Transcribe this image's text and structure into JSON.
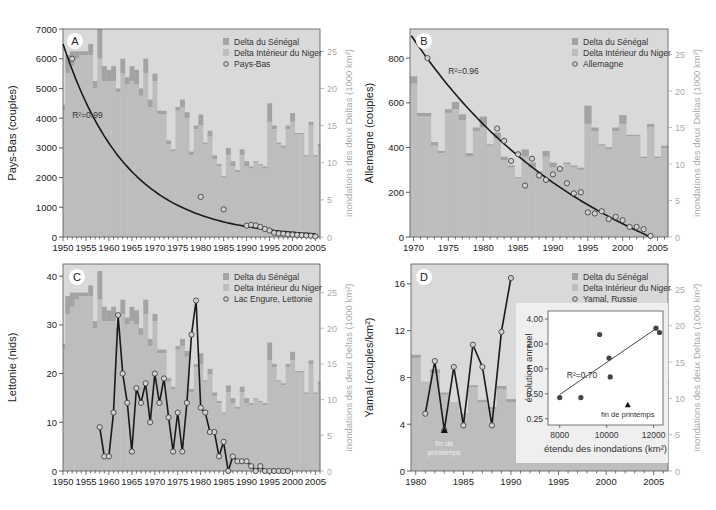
{
  "colors": {
    "background": "#d9d9d9",
    "niger": "#bdbdbd",
    "senegal": "#a3a3a3",
    "line": "#1a1a1a",
    "marker_fill": "#d0d0d0",
    "right_axis": "#aaaaaa"
  },
  "legend": {
    "senegal": "Delta du Sénégal",
    "niger": "Delta Intérieur du Niger"
  },
  "right_axis_label": "inondations des deux Deltas (1000 km²)",
  "chart_data": [
    {
      "id": "A",
      "type": "bar+line",
      "panel_letter": "A",
      "ylabel": "Pays-Bas (couples)",
      "ylabel_right": "inondations des deux Deltas (1000 km²)",
      "xlim": [
        1950,
        2006
      ],
      "ylim": [
        0,
        7000
      ],
      "ylim_right": [
        0,
        28
      ],
      "yticks": [
        0,
        1000,
        2000,
        3000,
        4000,
        5000,
        6000,
        7000
      ],
      "yticks_right": [
        0,
        5,
        10,
        15,
        20,
        25
      ],
      "xticks": [
        1950,
        1955,
        1960,
        1965,
        1970,
        1975,
        1980,
        1985,
        1990,
        1995,
        2000,
        2005
      ],
      "series_name": "Pays-Bas",
      "r2_label": "R²=0.99",
      "r2_pos": [
        1952,
        4000
      ],
      "fit": "exp",
      "fit_range": [
        1950,
        2005
      ],
      "fit_params": {
        "a": 6500,
        "b": -0.072,
        "x0": 1950
      },
      "points": [
        [
          1952,
          6000
        ],
        [
          1980,
          1350
        ],
        [
          1985,
          930
        ],
        [
          1990,
          380
        ],
        [
          1991,
          410
        ],
        [
          1992,
          390
        ],
        [
          1993,
          340
        ],
        [
          1994,
          270
        ],
        [
          1995,
          220
        ],
        [
          1996,
          140
        ],
        [
          1997,
          120
        ],
        [
          1998,
          110
        ],
        [
          1999,
          90
        ],
        [
          2000,
          80
        ],
        [
          2001,
          70
        ],
        [
          2002,
          60
        ],
        [
          2003,
          50
        ],
        [
          2004,
          40
        ],
        [
          2005,
          20
        ]
      ],
      "connect_points": false,
      "bars_years": [
        1950,
        1951,
        1952,
        1953,
        1954,
        1955,
        1956,
        1957,
        1958,
        1959,
        1960,
        1961,
        1962,
        1963,
        1964,
        1965,
        1966,
        1967,
        1968,
        1969,
        1970,
        1971,
        1972,
        1973,
        1974,
        1975,
        1976,
        1977,
        1978,
        1979,
        1980,
        1981,
        1982,
        1983,
        1984,
        1985,
        1986,
        1987,
        1988,
        1989,
        1990,
        1991,
        1992,
        1993,
        1994,
        1995,
        1996,
        1997,
        1998,
        1999,
        2000,
        2001,
        2002,
        2003,
        2004,
        2005,
        2006
      ],
      "bars_niger": [
        17,
        22,
        23,
        24,
        24.5,
        24.5,
        24.5,
        20,
        24,
        21,
        21,
        21,
        19.5,
        22,
        20.5,
        21,
        20.5,
        19,
        22,
        17.5,
        21,
        16.5,
        16.5,
        12.5,
        11.5,
        17,
        17.5,
        16,
        11,
        14.5,
        15,
        12.5,
        13.5,
        10.5,
        9.5,
        8,
        11,
        9.5,
        8.7,
        11,
        9.5,
        9.2,
        10,
        9.6,
        9.2,
        15.5,
        14.5,
        12.5,
        12,
        14.5,
        15.5,
        13.8,
        13.8,
        10.8,
        15,
        10.8,
        12.2
      ],
      "bars_total": [
        17.8,
        24.5,
        25,
        25,
        25,
        25,
        26,
        21,
        28,
        23,
        22.5,
        23,
        20,
        24,
        21.5,
        23,
        22.5,
        20,
        24,
        18.5,
        22,
        17,
        17,
        13,
        11.8,
        17.5,
        18.5,
        16.8,
        11.5,
        15,
        16.5,
        12.7,
        14.3,
        11,
        9.8,
        8.2,
        12,
        10.2,
        9,
        11.8,
        10.2,
        9.5,
        10.2,
        9.8,
        9.5,
        18,
        15,
        12.7,
        12.3,
        15,
        16.7,
        14,
        14,
        11,
        15.5,
        11,
        12.5
      ]
    },
    {
      "id": "B",
      "type": "bar+line",
      "panel_letter": "B",
      "ylabel": "Allemagne (couples)",
      "ylabel_right": "inondations des deux Deltas (1000 km²)",
      "xlim": [
        1969.5,
        2006.5
      ],
      "ylim": [
        0,
        930
      ],
      "ylim_right": [
        0,
        28.5
      ],
      "yticks": [
        0,
        200,
        400,
        600,
        800
      ],
      "yticks_right": [
        0,
        5,
        10,
        15,
        20,
        25
      ],
      "xticks": [
        1970,
        1975,
        1980,
        1985,
        1990,
        1995,
        2000,
        2005
      ],
      "series_name": "Allemagne",
      "r2_label": "R²=0.96",
      "r2_pos": [
        1975,
        730
      ],
      "fit": "exp2",
      "fit_range": [
        1969.7,
        2004
      ],
      "fit_params": {
        "a": 900,
        "b": -0.046,
        "x0": 1969.7,
        "end": 2004
      },
      "points": [
        [
          1972,
          800
        ],
        [
          1982,
          485
        ],
        [
          1983,
          430
        ],
        [
          1984,
          340
        ],
        [
          1985,
          370
        ],
        [
          1986,
          230
        ],
        [
          1987,
          350
        ],
        [
          1988,
          275
        ],
        [
          1989,
          255
        ],
        [
          1990,
          280
        ],
        [
          1991,
          305
        ],
        [
          1992,
          240
        ],
        [
          1993,
          195
        ],
        [
          1994,
          200
        ],
        [
          1995,
          110
        ],
        [
          1996,
          105
        ],
        [
          1997,
          115
        ],
        [
          1998,
          80
        ],
        [
          1999,
          90
        ],
        [
          2000,
          75
        ],
        [
          2001,
          45
        ],
        [
          2002,
          45
        ],
        [
          2003,
          35
        ],
        [
          2004,
          5
        ]
      ],
      "connect_points": false,
      "bars_years": [
        1970,
        1971,
        1972,
        1973,
        1974,
        1975,
        1976,
        1977,
        1978,
        1979,
        1980,
        1981,
        1982,
        1983,
        1984,
        1985,
        1986,
        1987,
        1988,
        1989,
        1990,
        1991,
        1992,
        1993,
        1994,
        1995,
        1996,
        1997,
        1998,
        1999,
        2000,
        2001,
        2002,
        2003,
        2004,
        2005,
        2006
      ],
      "bars_niger": [
        21,
        16.5,
        16.5,
        12.5,
        11.5,
        17,
        17.5,
        16,
        11,
        14.5,
        15,
        12.5,
        13.5,
        10.5,
        9.5,
        8,
        11,
        9.5,
        8.7,
        11,
        9.5,
        9.2,
        10,
        9.6,
        9.2,
        15.5,
        14.5,
        12.5,
        12,
        14.5,
        15.5,
        13.8,
        13.8,
        10.8,
        15,
        10.8,
        12.2
      ],
      "bars_total": [
        22,
        17,
        17,
        13,
        11.8,
        17.5,
        18.5,
        16.8,
        11.5,
        15,
        16.5,
        12.7,
        14.3,
        11,
        9.8,
        8.2,
        12,
        10.2,
        9,
        11.8,
        10.2,
        9.5,
        10.2,
        9.8,
        9.5,
        18,
        15,
        12.7,
        12.3,
        15,
        16.7,
        14,
        14,
        11,
        15.5,
        11,
        12.5
      ]
    },
    {
      "id": "C",
      "type": "bar+line",
      "panel_letter": "C",
      "ylabel": "Lettonie (nids)",
      "ylabel_right": "inondations des deux Deltas (1000 km²)",
      "xlim": [
        1950,
        2006
      ],
      "ylim": [
        0,
        42.5
      ],
      "ylim_right": [
        0,
        29
      ],
      "yticks": [
        0,
        10,
        20,
        30,
        40
      ],
      "yticks_right": [
        0,
        5,
        10,
        15,
        20,
        25
      ],
      "xticks": [
        1950,
        1955,
        1960,
        1965,
        1970,
        1975,
        1980,
        1985,
        1990,
        1995,
        2000,
        2005
      ],
      "series_name": "Lac Engure, Lettonie",
      "r2_label": "",
      "points": [
        [
          1958,
          9
        ],
        [
          1959,
          3
        ],
        [
          1960,
          3
        ],
        [
          1961,
          12
        ],
        [
          1962,
          32
        ],
        [
          1963,
          20
        ],
        [
          1964,
          14
        ],
        [
          1965,
          4
        ],
        [
          1966,
          17
        ],
        [
          1967,
          14
        ],
        [
          1968,
          18
        ],
        [
          1969,
          10
        ],
        [
          1970,
          20
        ],
        [
          1971,
          14
        ],
        [
          1972,
          19
        ],
        [
          1973,
          11
        ],
        [
          1974,
          4
        ],
        [
          1975,
          12
        ],
        [
          1976,
          4
        ],
        [
          1977,
          14
        ],
        [
          1978,
          28
        ],
        [
          1979,
          35
        ],
        [
          1980,
          13
        ],
        [
          1981,
          12
        ],
        [
          1982,
          8
        ],
        [
          1983,
          8
        ],
        [
          1984,
          3
        ],
        [
          1985,
          6
        ],
        [
          1986,
          0
        ],
        [
          1987,
          3
        ],
        [
          1988,
          2
        ],
        [
          1989,
          2
        ],
        [
          1990,
          2
        ],
        [
          1991,
          1
        ],
        [
          1992,
          0
        ],
        [
          1993,
          1
        ],
        [
          1994,
          0
        ],
        [
          1995,
          0
        ],
        [
          1996,
          0
        ],
        [
          1997,
          0
        ],
        [
          1998,
          0
        ],
        [
          1999,
          0
        ]
      ],
      "connect_points": true,
      "bars_years": [
        1950,
        1951,
        1952,
        1953,
        1954,
        1955,
        1956,
        1957,
        1958,
        1959,
        1960,
        1961,
        1962,
        1963,
        1964,
        1965,
        1966,
        1967,
        1968,
        1969,
        1970,
        1971,
        1972,
        1973,
        1974,
        1975,
        1976,
        1977,
        1978,
        1979,
        1980,
        1981,
        1982,
        1983,
        1984,
        1985,
        1986,
        1987,
        1988,
        1989,
        1990,
        1991,
        1992,
        1993,
        1994,
        1995,
        1996,
        1997,
        1998,
        1999,
        2000,
        2001,
        2002,
        2003,
        2004,
        2005,
        2006
      ],
      "bars_niger": [
        17,
        22,
        23,
        24,
        24.5,
        24.5,
        24.5,
        20,
        24,
        21,
        21,
        21,
        19.5,
        22,
        20.5,
        21,
        20.5,
        19,
        22,
        17.5,
        21,
        16.5,
        16.5,
        12.5,
        11.5,
        17,
        17.5,
        16,
        11,
        14.5,
        15,
        12.5,
        13.5,
        10.5,
        9.5,
        8,
        11,
        9.5,
        8.7,
        11,
        9.5,
        9.2,
        10,
        9.6,
        9.2,
        15.5,
        14.5,
        12.5,
        12,
        14.5,
        15.5,
        13.8,
        13.8,
        10.8,
        15,
        10.8,
        12.2
      ],
      "bars_total": [
        17.8,
        24.5,
        25,
        25,
        25,
        25,
        26,
        21,
        28,
        23,
        22.5,
        23,
        20,
        24,
        21.5,
        23,
        22.5,
        20,
        24,
        18.5,
        22,
        17,
        17,
        13,
        11.8,
        17.5,
        18.5,
        16.8,
        11.5,
        15,
        16.5,
        12.7,
        14.3,
        11,
        9.8,
        8.2,
        12,
        10.2,
        9,
        11.8,
        10.2,
        9.5,
        10.2,
        9.8,
        9.5,
        18,
        15,
        12.7,
        12.3,
        15,
        16.7,
        14,
        14,
        11,
        15.5,
        11,
        12.5
      ]
    },
    {
      "id": "D",
      "type": "bar+line",
      "panel_letter": "D",
      "ylabel": "Yamal (couples/km²)",
      "ylabel_right": "inondations des deux Deltas (1000 km²)",
      "xlim": [
        1979.5,
        2006.5
      ],
      "ylim": [
        0,
        17.7
      ],
      "ylim_right": [
        0,
        28.5
      ],
      "yticks": [
        0,
        4,
        8,
        12,
        16
      ],
      "yticks_right": [
        0,
        5,
        10,
        15,
        20,
        25
      ],
      "xticks": [
        1980,
        1985,
        1990,
        1995,
        2000,
        2005
      ],
      "series_name": "Yamal, Russie",
      "r2_label": "",
      "points": [
        [
          1981,
          4.9
        ],
        [
          1982,
          9.4
        ],
        [
          1983,
          3.5
        ],
        [
          1984,
          8.9
        ],
        [
          1985,
          3.9
        ],
        [
          1986,
          10.8
        ],
        [
          1987,
          8.9
        ],
        [
          1988,
          3.9
        ],
        [
          1989,
          11.9
        ],
        [
          1990,
          16.5
        ]
      ],
      "late_spring_point": [
        1983,
        3.5
      ],
      "late_spring_label": "fin de printemps",
      "connect_points": true,
      "bars_years": [
        1980,
        1981,
        1982,
        1983,
        1984,
        1985,
        1986,
        1987,
        1988,
        1989,
        1990,
        1991,
        1992,
        1993,
        1994,
        1995,
        1996,
        1997,
        1998,
        1999,
        2000,
        2001,
        2002,
        2003,
        2004,
        2005,
        2006
      ],
      "bars_niger": [
        15.5,
        12.3,
        13.5,
        10.5,
        9.5,
        8,
        11.5,
        9.5,
        8.5,
        11.3,
        9.5,
        9.2,
        10,
        9.6,
        9.2,
        15.5,
        14.5,
        12.5,
        12,
        14.5,
        15.5,
        13.8,
        13.8,
        10.8,
        15,
        10.8,
        12.2
      ],
      "bars_total": [
        16,
        12.3,
        14,
        10.8,
        9.5,
        8,
        11.8,
        9.8,
        8.8,
        11.7,
        9.9,
        9.5,
        10.2,
        9.8,
        9.5,
        18,
        15,
        12.7,
        12.3,
        15,
        16.7,
        14,
        14,
        11,
        15.5,
        11,
        12.5
      ],
      "inset": {
        "type": "scatter",
        "xlabel": "étendu des inondations (km²)",
        "ylabel": "évolution annuel",
        "xticks": [
          8000,
          10000,
          12000
        ],
        "yticks": [
          0.25,
          0.5,
          1.0,
          2.0,
          4.0
        ],
        "ytick_labels": [
          "0.25",
          "0.50",
          "1.00",
          "2.00",
          "4.00"
        ],
        "yscale": "log2",
        "xlim": [
          7500,
          12400
        ],
        "ylim": [
          0.21,
          5.0
        ],
        "points": [
          [
            8000,
            0.45
          ],
          [
            8900,
            0.45
          ],
          [
            9700,
            2.6
          ],
          [
            10100,
            1.35
          ],
          [
            10150,
            0.8
          ],
          [
            12100,
            3.1
          ],
          [
            12250,
            2.75
          ]
        ],
        "late_spring_point": [
          10900,
          0.37
        ],
        "late_spring_label": "fin de printemps",
        "fit_line": [
          [
            8000,
            0.49
          ],
          [
            12200,
            3.2
          ]
        ],
        "r2_label": "R²=0.70"
      }
    }
  ]
}
